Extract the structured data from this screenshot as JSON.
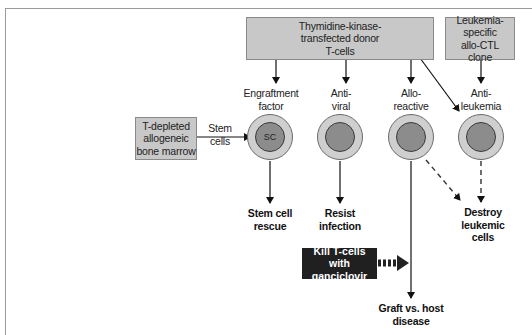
{
  "diagram": {
    "sources": {
      "tk_donor": "Thymidine-kinase-\ntransfected donor\nT-cells",
      "leukemia_ctl": "Leukemia-specific\nallo-CTL\nclone",
      "bone_marrow": "T-depleted\nallogeneic\nbone marrow"
    },
    "edge_labels": {
      "stem_cells": "Stem\ncells"
    },
    "cells": [
      {
        "label": "Engraftment\nfactor",
        "nucleus": "SC"
      },
      {
        "label": "Anti-\nviral",
        "nucleus": ""
      },
      {
        "label": "Allo-\nreactive",
        "nucleus": ""
      },
      {
        "label": "Anti-\nleukemia",
        "nucleus": ""
      }
    ],
    "outcomes": {
      "stem_cell_rescue": "Stem cell\nrescue",
      "resist_infection": "Resist\ninfection",
      "destroy_leukemic": "Destroy\nleukemic\ncells",
      "gvhd": "Graft vs. host\ndisease"
    },
    "intervention": "Kill T-cells\nwith ganciclovir",
    "colors": {
      "box_fill": "#c8c8c8",
      "cell_outer": "#cfcfcf",
      "cell_nucleus": "#8c8c8c",
      "intervention_fill": "#202020"
    }
  }
}
